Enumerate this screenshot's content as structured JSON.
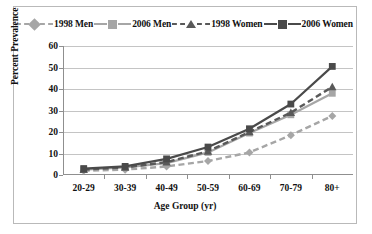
{
  "chart_data": {
    "type": "line",
    "title": "",
    "xlabel": "Age Group (yr)",
    "ylabel": "Percent Prevalence",
    "categories": [
      "20-29",
      "30-39",
      "40-49",
      "50-59",
      "60-69",
      "70-79",
      "80+"
    ],
    "ylim": [
      0,
      60
    ],
    "yticks": [
      0,
      10,
      20,
      30,
      40,
      50,
      60
    ],
    "grid": true,
    "legend_position": "top",
    "series": [
      {
        "name": "1998 Men",
        "values": [
          2.0,
          2.5,
          4.0,
          6.5,
          10.5,
          18.5,
          27.5
        ],
        "color": "#a6a6a6",
        "dash": "dashed",
        "marker": "diamond"
      },
      {
        "name": "2006 Men",
        "values": [
          2.5,
          3.5,
          5.5,
          10.5,
          19.5,
          28.0,
          38.0
        ],
        "color": "#a6a6a6",
        "dash": "solid",
        "marker": "square"
      },
      {
        "name": "1998 Women",
        "values": [
          2.5,
          3.5,
          6.0,
          11.0,
          20.0,
          29.0,
          41.0
        ],
        "color": "#595959",
        "dash": "dashed",
        "marker": "triangle"
      },
      {
        "name": "2006 Women",
        "values": [
          3.0,
          4.0,
          7.5,
          13.0,
          21.5,
          33.0,
          50.5
        ],
        "color": "#4a4a4a",
        "dash": "solid",
        "marker": "square"
      }
    ]
  },
  "colors": {
    "frame": "#b9b9b9",
    "grid": "#c4c4c4",
    "axis": "#8f8f8f",
    "text": "#111111",
    "background": "#ffffff"
  }
}
